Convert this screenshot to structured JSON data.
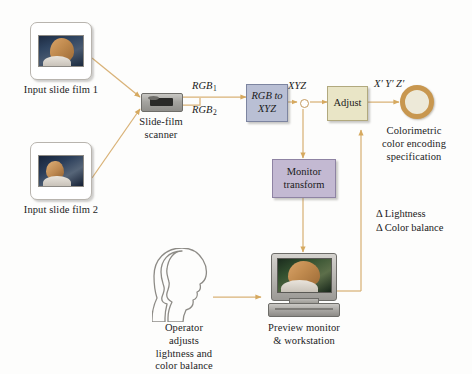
{
  "diagram": {
    "background_color": "#fdfdfc",
    "arrow_color": "#d3a86a",
    "inputs": [
      {
        "id": "slide1",
        "caption": "Input slide film 1",
        "icon": "slide-film-icon"
      },
      {
        "id": "slide2",
        "caption": "Input slide film 2",
        "icon": "slide-film-icon"
      }
    ],
    "scanner": {
      "caption_line1": "Slide-film",
      "caption_line2": "scanner",
      "icon": "film-scanner-icon"
    },
    "signals": {
      "rgb1_base": "RGB",
      "rgb1_sub": "1",
      "rgb2_base": "RGB",
      "rgb2_sub": "2",
      "xyz": "XYZ",
      "xyz_prime": "X′ Y′ Z′"
    },
    "boxes": [
      {
        "id": "rgb-to-xyz",
        "line1": "RGB to",
        "line2": "XYZ",
        "color": "#b9bfd4",
        "border": "#7d85a0"
      },
      {
        "id": "adjust",
        "line1": "Adjust",
        "line2": "",
        "color": "#e9e5c6",
        "border": "#b1a97e"
      },
      {
        "id": "monitor-transform",
        "line1": "Monitor",
        "line2": "transform",
        "color": "#c3b9d2",
        "border": "#8e83a3"
      }
    ],
    "output": {
      "icon": "colorimetric-ring-icon",
      "ring_color": "#c8974f",
      "fill_color": "#ede9d8",
      "caption_line1": "Colorimetric",
      "caption_line2": "color encoding",
      "caption_line3": "specification"
    },
    "workstation": {
      "icon": "crt-workstation-icon",
      "caption_line1": "Preview monitor",
      "caption_line2": "& workstation"
    },
    "operator": {
      "icon": "operator-head-silhouette-icon",
      "caption_line1": "Operator",
      "caption_line2": "adjusts",
      "caption_line3": "lightness and",
      "caption_line4": "color balance"
    },
    "feedback": {
      "line1": "Δ Lightness",
      "line2": "Δ Color balance"
    },
    "junction": {
      "id": "xyz-split-node",
      "fill": "#ffffff",
      "stroke": "#c49a60"
    }
  }
}
